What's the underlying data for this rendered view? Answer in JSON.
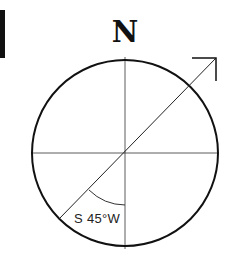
{
  "diagram": {
    "north_label": "N",
    "bearing_label": "S 45°W",
    "bearing_angle_deg": 45,
    "colors": {
      "stroke": "#111111",
      "thin_stroke": "#333333",
      "background": "#ffffff"
    },
    "elements": {
      "circle": {
        "cx": 125,
        "cy": 153,
        "r": 93
      },
      "arrow": {
        "from": "lower-left (S45°W point on circle)",
        "to": "upper-right (NE)",
        "direction": "NE"
      }
    }
  }
}
